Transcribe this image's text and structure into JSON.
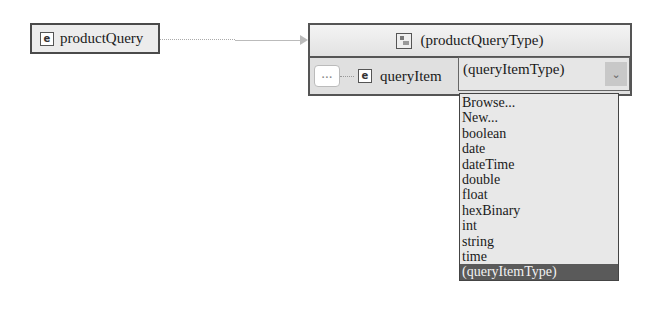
{
  "root_element": {
    "icon": "element-icon",
    "icon_glyph": "e",
    "name": "productQuery"
  },
  "type_box": {
    "header": {
      "icon": "complex-type-icon",
      "title": "(productQueryType)"
    },
    "row": {
      "sequence_icon": "sequence-icon",
      "sequence_glyph": "∙∙∙",
      "element_icon_glyph": "e",
      "element_name": "queryItem",
      "type_select": {
        "value": "(queryItemType)",
        "button_glyph": "⌄"
      }
    }
  },
  "dropdown": {
    "options": [
      "Browse...",
      "New...",
      "boolean",
      "date",
      "dateTime",
      "double",
      "float",
      "hexBinary",
      "int",
      "string",
      "time",
      "(queryItemType)"
    ],
    "selected_index": 11
  },
  "colors": {
    "border": "#555555",
    "row_bg": "#e0e0e0",
    "dropdown_bg": "#e8e8e8",
    "selected_bg": "#5a5a5a"
  }
}
